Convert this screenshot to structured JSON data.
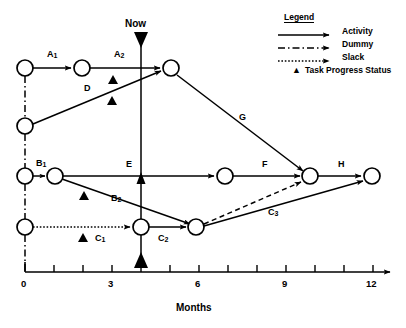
{
  "diagram": {
    "axis": {
      "label": "Months",
      "ticks": [
        0,
        1,
        2,
        3,
        4,
        5,
        6,
        7,
        8,
        9,
        10,
        11,
        12
      ],
      "tick_labels": [
        "0",
        "3",
        "6",
        "9",
        "12"
      ],
      "tick_label_values": [
        0,
        3,
        6,
        9,
        12
      ],
      "range": [
        0,
        12
      ]
    },
    "now_marker": {
      "label": "Now",
      "value": 4
    },
    "activities": [
      {
        "id": "A1",
        "label": "A",
        "sub": "1",
        "type": "activity",
        "from": [
          0,
          68
        ],
        "to": [
          3,
          68
        ]
      },
      {
        "id": "A2",
        "label": "A",
        "sub": "2",
        "type": "activity",
        "from": [
          3,
          68
        ],
        "to": [
          6,
          68
        ]
      },
      {
        "id": "D",
        "label": "D",
        "sub": "",
        "type": "activity",
        "from": [
          0,
          126
        ],
        "to": [
          6,
          68
        ]
      },
      {
        "id": "G",
        "label": "G",
        "sub": "",
        "type": "activity",
        "from": [
          6,
          68
        ],
        "to": [
          10,
          176
        ]
      },
      {
        "id": "B1",
        "label": "B",
        "sub": "1",
        "type": "activity",
        "from": [
          0,
          176
        ],
        "to": [
          1,
          176
        ]
      },
      {
        "id": "B2",
        "label": "B",
        "sub": "2",
        "type": "activity",
        "from": [
          1,
          176
        ],
        "to": [
          6,
          227
        ]
      },
      {
        "id": "E",
        "label": "E",
        "sub": "",
        "type": "activity",
        "from": [
          1,
          176
        ],
        "to": [
          7,
          176
        ]
      },
      {
        "id": "F",
        "label": "F",
        "sub": "",
        "type": "activity",
        "from": [
          7,
          176
        ],
        "to": [
          10,
          176
        ]
      },
      {
        "id": "H",
        "label": "H",
        "sub": "",
        "type": "activity",
        "from": [
          10,
          176
        ],
        "to": [
          12,
          176
        ]
      },
      {
        "id": "C1",
        "label": "C",
        "sub": "1",
        "type": "slack",
        "from": [
          0,
          227
        ],
        "to": [
          4,
          227
        ]
      },
      {
        "id": "C2",
        "label": "C",
        "sub": "2",
        "type": "activity",
        "from": [
          4,
          227
        ],
        "to": [
          6,
          227
        ]
      },
      {
        "id": "C3",
        "label": "C",
        "sub": "3",
        "type": "activity",
        "from": [
          6,
          227
        ],
        "to": [
          12,
          176
        ]
      }
    ],
    "dummies": [
      {
        "from": [
          0,
          68
        ],
        "to": [
          0,
          126
        ]
      },
      {
        "from": [
          0,
          126
        ],
        "to": [
          0,
          176
        ]
      },
      {
        "from": [
          0,
          176
        ],
        "to": [
          0,
          227
        ]
      },
      {
        "from": [
          0,
          227
        ],
        "to": [
          0,
          272
        ]
      },
      {
        "from": [
          6,
          227
        ],
        "to": [
          10,
          176
        ]
      }
    ],
    "progress_markers": [
      {
        "activity": "A2",
        "x": 113,
        "y": 80
      },
      {
        "activity": "D",
        "x": 112,
        "y": 101
      },
      {
        "activity": "B2",
        "x": 84,
        "y": 196
      },
      {
        "activity": "C1",
        "x": 83,
        "y": 238
      }
    ],
    "nodes": [
      {
        "x": 25,
        "y": 68
      },
      {
        "x": 82,
        "y": 68
      },
      {
        "x": 171,
        "y": 68
      },
      {
        "x": 25,
        "y": 126
      },
      {
        "x": 25,
        "y": 176
      },
      {
        "x": 55,
        "y": 176
      },
      {
        "x": 225,
        "y": 176
      },
      {
        "x": 310,
        "y": 176
      },
      {
        "x": 372,
        "y": 176
      },
      {
        "x": 25,
        "y": 227
      },
      {
        "x": 141,
        "y": 227
      },
      {
        "x": 196,
        "y": 227
      }
    ]
  },
  "legend": {
    "title": "Legend",
    "items": [
      {
        "key": "solid-arrow",
        "label": "Activity"
      },
      {
        "key": "dashdot-arrow",
        "label": "Dummy"
      },
      {
        "key": "dotted-arrow",
        "label": "Slack"
      },
      {
        "key": "triangle",
        "label": "Task Progress Status"
      }
    ]
  },
  "labels": {
    "a1": "A",
    "a1sub": "1",
    "a2": "A",
    "a2sub": "2",
    "d": "D",
    "g": "G",
    "b1": "B",
    "b1sub": "1",
    "b2": "B",
    "b2sub": "2",
    "e": "E",
    "f": "F",
    "h": "H",
    "c1": "C",
    "c1sub": "1",
    "c2": "C",
    "c2sub": "2",
    "c3": "C",
    "c3sub": "3",
    "now": "Now",
    "months": "Months",
    "t0": "0",
    "t3": "3",
    "t6": "6",
    "t9": "9",
    "t12": "12"
  },
  "colors": {
    "stroke": "#000000",
    "background": "#ffffff"
  }
}
